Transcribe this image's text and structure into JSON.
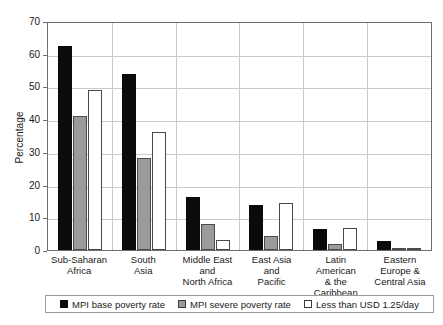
{
  "chart_data": {
    "type": "bar",
    "title": "",
    "xlabel": "",
    "ylabel": "Percentage",
    "ylim": [
      0,
      70
    ],
    "yticks": [
      0,
      10,
      20,
      30,
      40,
      50,
      60,
      70
    ],
    "grid": true,
    "legend_position": "bottom",
    "categories": [
      "Sub-Saharan\nAfrica",
      "South\nAsia",
      "Middle East\nand\nNorth Africa",
      "East Asia\nand\nPacific",
      "Latin American\n& the\nCaribbean",
      "Eastern\nEurope &\nCentral Asia"
    ],
    "category_lines": [
      [
        "Sub-Saharan",
        "Africa"
      ],
      [
        "South",
        "Asia"
      ],
      [
        "Middle East",
        "and",
        "North Africa"
      ],
      [
        "East Asia",
        "and",
        "Pacific"
      ],
      [
        "Latin American",
        "& the",
        "Caribbean"
      ],
      [
        "Eastern",
        "Europe &",
        "Central Asia"
      ]
    ],
    "series": [
      {
        "name": "MPI base poverty rate",
        "color": "#0b0b0b",
        "values": [
          62.5,
          53.8,
          16.3,
          13.8,
          6.5,
          2.7
        ]
      },
      {
        "name": "MPI severe poverty rate",
        "color": "#9b9b9b",
        "values": [
          41.0,
          28.0,
          8.0,
          4.3,
          1.8,
          0.6
        ]
      },
      {
        "name": "Less than USD 1.25/day",
        "color": "#ffffff",
        "values": [
          49.0,
          36.0,
          3.0,
          14.5,
          6.6,
          0.5
        ]
      }
    ]
  },
  "axis": {
    "y_title": "Percentage",
    "y_tick_labels": [
      "70",
      "60",
      "50",
      "40",
      "30",
      "20",
      "10",
      "0"
    ]
  },
  "legend": {
    "items": [
      {
        "label": "MPI base poverty rate",
        "swatch": "black-square-icon"
      },
      {
        "label": "MPI severe poverty rate",
        "swatch": "gray-square-icon"
      },
      {
        "label": "Less than USD 1.25/day",
        "swatch": "white-square-icon"
      }
    ]
  }
}
